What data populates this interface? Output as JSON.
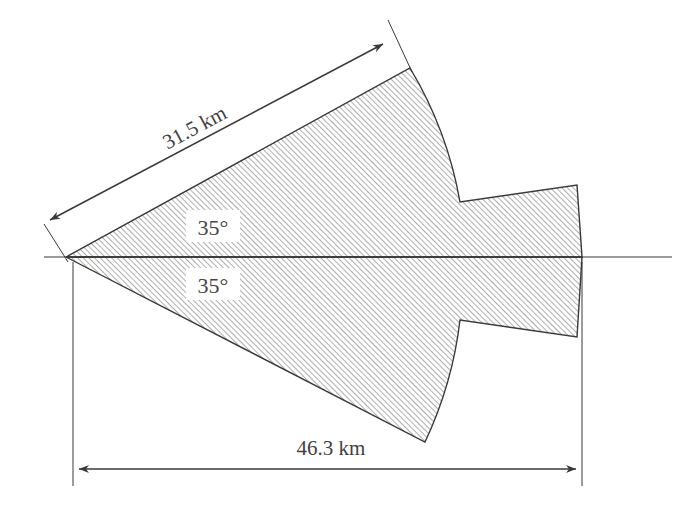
{
  "diagram": {
    "background_color": "#ffffff",
    "stroke_color": "#3b3836",
    "hatch_color": "#6d6a68",
    "fill_color": "#ffffff",
    "labels": {
      "slant_distance": "31.5 km",
      "horizontal_distance": "46.3 km",
      "angle_upper": "35°",
      "angle_lower": "35°"
    },
    "dimensions": [
      {
        "name": "slant-dimension",
        "value": "31.5 km",
        "unit": "km",
        "magnitude": 31.5,
        "orientation": "diagonal",
        "rotation_deg": -32,
        "arrow_style": "double-headed",
        "from": [
          44,
          224
        ],
        "to": [
          388,
          42
        ]
      },
      {
        "name": "width-dimension",
        "value": "46.3 km",
        "unit": "km",
        "magnitude": 46.3,
        "orientation": "horizontal",
        "rotation_deg": 0,
        "arrow_style": "double-headed",
        "from": [
          73,
          469
        ],
        "to": [
          582,
          469
        ]
      }
    ],
    "angles": [
      {
        "name": "upper-half-angle",
        "value": "35°",
        "magnitude": 35,
        "position": [
          212,
          228
        ]
      },
      {
        "name": "lower-half-angle",
        "value": "35°",
        "magnitude": 35,
        "position": [
          212,
          285
        ]
      }
    ],
    "axis": {
      "name": "center-axis",
      "from": [
        44,
        257
      ],
      "to": [
        672,
        257
      ]
    },
    "apex": [
      66,
      257
    ]
  }
}
